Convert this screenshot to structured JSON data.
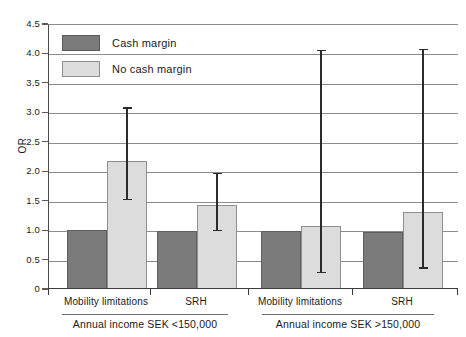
{
  "chart_data": {
    "type": "bar",
    "title": "",
    "xlabel": "",
    "ylabel": "OR",
    "ylim": [
      0,
      4.5
    ],
    "ytick_labels": [
      "4.5",
      "4.0",
      "3.5",
      "3.0",
      "2.5",
      "2.0",
      "1.5",
      "1.0",
      "0.5",
      "0"
    ],
    "ytick_values": [
      4.5,
      4.0,
      3.5,
      3.0,
      2.5,
      2.0,
      1.5,
      1.0,
      0.5,
      0
    ],
    "grid": true,
    "legend_position": "upper-left",
    "categories": [
      "Mobility limitations",
      "SRH",
      "Mobility limitations",
      "SRH"
    ],
    "groups": [
      {
        "label": "Annual income SEK <150,000",
        "categories": [
          "Mobility limitations",
          "SRH"
        ]
      },
      {
        "label": "Annual income SEK >150,000",
        "categories": [
          "Mobility limitations",
          "SRH"
        ]
      }
    ],
    "series": [
      {
        "name": "Cash margin",
        "color": "#7b7b7b",
        "values": [
          1.0,
          0.99,
          0.98,
          0.97
        ],
        "errors_low": [
          null,
          null,
          null,
          null
        ],
        "errors_high": [
          null,
          null,
          null,
          null
        ]
      },
      {
        "name": "No cash margin",
        "color": "#dcdcdc",
        "values": [
          2.18,
          1.43,
          1.07,
          1.31
        ],
        "errors_low": [
          1.52,
          1.0,
          0.29,
          0.36
        ],
        "errors_high": [
          3.1,
          1.99,
          4.08,
          4.1
        ]
      }
    ]
  },
  "legend": {
    "items": [
      {
        "label": "Cash margin",
        "swatch": "cash"
      },
      {
        "label": "No cash margin",
        "swatch": "nocash"
      }
    ]
  },
  "axis": {
    "y_title": "OR"
  }
}
